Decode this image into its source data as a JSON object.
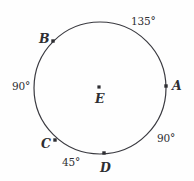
{
  "figure": {
    "type": "circle-diagram",
    "background_color": "#fefefe",
    "stroke_color": "#3a3a40",
    "text_color": "#2e2e32",
    "circle": {
      "center_x": 100,
      "center_y": 88,
      "radius": 66,
      "stroke_width": 1.2
    },
    "center_point": {
      "name": "point-E",
      "label": "E",
      "dot_x": 99,
      "dot_y": 87,
      "label_x": 95,
      "label_y": 93
    },
    "points": [
      {
        "name": "point-A",
        "label": "A",
        "dot_x": 166,
        "dot_y": 86,
        "label_x": 172,
        "label_y": 80
      },
      {
        "name": "point-B",
        "label": "B",
        "dot_x": 53,
        "dot_y": 41,
        "label_x": 39,
        "label_y": 33
      },
      {
        "name": "point-C",
        "label": "C",
        "dot_x": 55,
        "dot_y": 140,
        "label_x": 41,
        "label_y": 138
      },
      {
        "name": "point-D",
        "label": "D",
        "dot_x": 104,
        "dot_y": 153,
        "label_x": 100,
        "label_y": 162
      }
    ],
    "arc_labels": [
      {
        "name": "arc-label-ab",
        "label": "135°",
        "x": 131,
        "y": 16
      },
      {
        "name": "arc-label-bc",
        "label": "90°",
        "x": 12,
        "y": 81
      },
      {
        "name": "arc-label-cd",
        "label": "45°",
        "x": 62,
        "y": 157
      },
      {
        "name": "arc-label-da",
        "label": "90°",
        "x": 157,
        "y": 133
      }
    ]
  },
  "chart_data": {
    "type": "pie",
    "title": "",
    "categories": [
      "arc AB",
      "arc BC",
      "arc CD",
      "arc DA"
    ],
    "values": [
      135,
      90,
      45,
      90
    ],
    "unit": "degrees",
    "total": 360,
    "labels": [
      "135°",
      "90°",
      "45°",
      "90°"
    ],
    "points": [
      "A",
      "B",
      "C",
      "D"
    ],
    "center": "E",
    "grid": false,
    "legend": "none"
  }
}
